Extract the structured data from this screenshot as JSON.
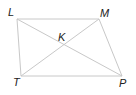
{
  "diagram": {
    "type": "quadrilateral-with-diagonals",
    "points": {
      "L": {
        "label": "L",
        "x": 17,
        "y": 19,
        "lx": 8,
        "ly": 16
      },
      "M": {
        "label": "M",
        "x": 99,
        "y": 19,
        "lx": 100,
        "ly": 17
      },
      "T": {
        "label": "T",
        "x": 21,
        "y": 76,
        "lx": 13,
        "ly": 86
      },
      "P": {
        "label": "P",
        "x": 122,
        "y": 76,
        "lx": 119,
        "ly": 87
      },
      "K": {
        "label": "K",
        "x": 65,
        "y": 46,
        "lx": 58,
        "ly": 41
      }
    },
    "edges": [
      [
        "L",
        "M"
      ],
      [
        "M",
        "P"
      ],
      [
        "P",
        "T"
      ],
      [
        "T",
        "L"
      ],
      [
        "L",
        "P"
      ],
      [
        "M",
        "T"
      ]
    ],
    "colors": {
      "line": "#c8c8c8",
      "text": "#222222",
      "background": "#ffffff"
    }
  }
}
